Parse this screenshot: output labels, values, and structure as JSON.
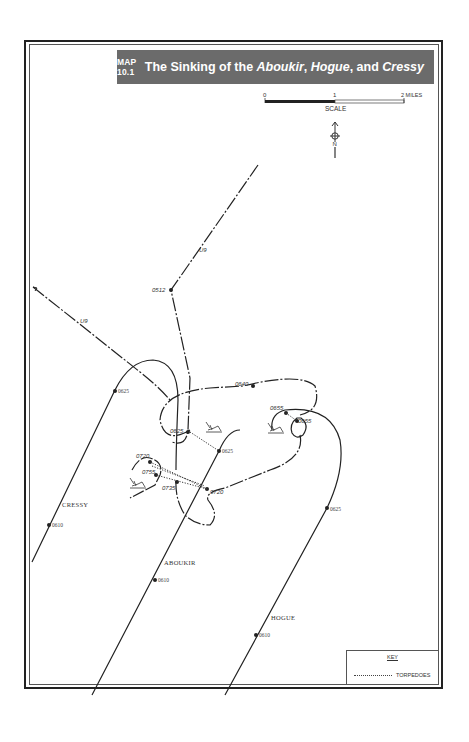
{
  "header": {
    "map_number": "MAP 10.1",
    "title_prefix": "The Sinking of the ",
    "ship1": "Aboukir",
    "sep1": ", ",
    "ship2": "Hogue",
    "sep2": ", and ",
    "ship3": "Cressy"
  },
  "scale": {
    "ticks": [
      "0",
      "1",
      "2 MILES"
    ],
    "label": "SCALE"
  },
  "north_arrow": {
    "label": "N"
  },
  "tracks": {
    "submarine": {
      "name": "U9",
      "labels": [
        "U9",
        "U9"
      ],
      "times": [
        "0512"
      ]
    },
    "cressy": {
      "name": "CRESSY",
      "times": [
        "0610",
        "0625",
        "0720",
        "0755"
      ]
    },
    "aboukir": {
      "name": "ABOUKIR",
      "times": [
        "0610",
        "0625",
        "0640"
      ]
    },
    "hogue": {
      "name": "HOGUE",
      "times": [
        "0610",
        "0625",
        "0655",
        "0655",
        "0720",
        "0735"
      ]
    }
  },
  "time_labels": {
    "t0512": "0512",
    "t0625_cressy": "0625",
    "t0610_cressy": "0610",
    "t0625_aboukir": "0625",
    "t0625_u9": "0625",
    "t0640": "0640",
    "t0655a": "0655",
    "t0655b": "0655",
    "t0720a": "0720",
    "t0720b": "0720",
    "t0755": "0755",
    "t0735": "0735",
    "t0610_aboukir": "0610",
    "t0625_hogue": "0625",
    "t0610_hogue": "0610"
  },
  "ship_labels": {
    "cressy": "CRESSY",
    "aboukir": "ABOUKIR",
    "hogue": "HOGUE",
    "u9_top": "U9",
    "u9_left": "U9"
  },
  "key": {
    "title": "KEY",
    "items": [
      {
        "symbol": "dotted-line",
        "label": "TORPEDOES"
      }
    ]
  }
}
